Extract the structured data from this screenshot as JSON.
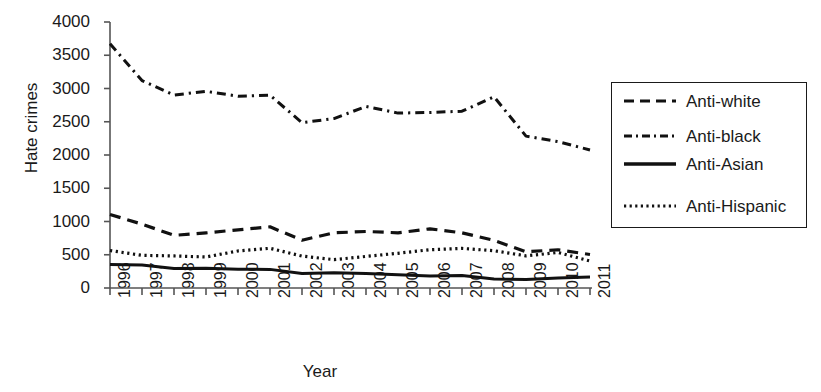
{
  "chart_data": {
    "type": "line",
    "title": "",
    "xlabel": "Year",
    "ylabel": "Hate crimes",
    "x": [
      1996,
      1997,
      1998,
      1999,
      2000,
      2001,
      2002,
      2003,
      2004,
      2005,
      2006,
      2007,
      2008,
      2009,
      2010,
      2011
    ],
    "xticklabels": [
      "1996",
      "1997",
      "1998",
      "1999",
      "2000",
      "2001",
      "2002",
      "2003",
      "2004",
      "2005",
      "2006",
      "2007",
      "2008",
      "2009",
      "2010",
      "2011"
    ],
    "ylim": [
      0,
      4000
    ],
    "yticks": [
      0,
      500,
      1000,
      1500,
      2000,
      2500,
      3000,
      3500,
      4000
    ],
    "yticklabels": [
      "0",
      "500",
      "1000",
      "1500",
      "2000",
      "2500",
      "3000",
      "3500",
      "4000"
    ],
    "grid": false,
    "legend_position": "right",
    "series": [
      {
        "name": "Anti-white",
        "style": "dashed",
        "color": "#111111",
        "values": [
          1106,
          960,
          792,
          829,
          875,
          920,
          719,
          830,
          850,
          830,
          890,
          830,
          716,
          545,
          575,
          504
        ]
      },
      {
        "name": "Anti-black",
        "style": "dashdot",
        "color": "#111111",
        "values": [
          3674,
          3120,
          2901,
          2958,
          2884,
          2899,
          2486,
          2548,
          2731,
          2630,
          2640,
          2658,
          2876,
          2284,
          2201,
          2076
        ]
      },
      {
        "name": "Anti-Asian",
        "style": "solid",
        "color": "#111111",
        "values": [
          355,
          347,
          293,
          298,
          281,
          280,
          217,
          231,
          217,
          199,
          181,
          188,
          137,
          126,
          150,
          165
        ]
      },
      {
        "name": "Anti-Hispanic",
        "style": "dotted",
        "color": "#111111",
        "values": [
          564,
          491,
          482,
          466,
          557,
          597,
          480,
          426,
          475,
          522,
          576,
          595,
          561,
          483,
          534,
          405
        ]
      }
    ]
  },
  "legend": {
    "entries": [
      {
        "label": "Anti-white",
        "style": "dashed"
      },
      {
        "label": "Anti-black",
        "style": "dashdot"
      },
      {
        "label": "Anti-Asian",
        "style": "solid"
      },
      {
        "label": "Anti-Hispanic",
        "style": "dotted"
      }
    ]
  },
  "axes": {
    "y_title": "Hate crimes",
    "x_title": "Year"
  }
}
